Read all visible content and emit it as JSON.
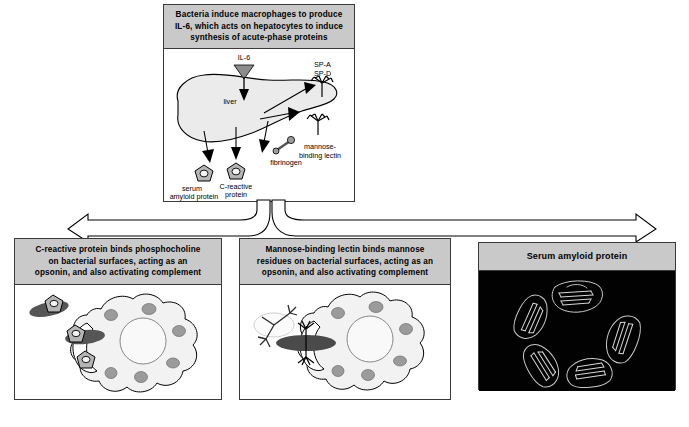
{
  "figure": {
    "domain": "biology-immunology-diagram",
    "background": "#ffffff"
  },
  "colors": {
    "caption_gray": "#c9c9c9",
    "border": "#3a3a3a",
    "liver_fill": "#ebebeb",
    "cell_fill": "#f2f2f2",
    "granule_fill": "#9b9b9b",
    "nucleus_fill": "#f7f7f7",
    "bacteria_dark": "#565656",
    "protein_fill": "#b5b5b5",
    "arrow_black": "#000000",
    "il6_triangle": "#8c8c8c",
    "panel3_black": "#020202",
    "ribbon_white": "#dedede"
  },
  "top_panel": {
    "caption": "Bacteria induce macrophages to produce IL-6, which acts on hepatocytes to induce synthesis of acute-phase proteins",
    "caption_lines": [
      "Bacteria induce macrophages to produce",
      "IL-6, which acts on hepatocytes to induce",
      "synthesis of acute-phase proteins"
    ],
    "labels": {
      "il6": "IL-6",
      "liver": "liver",
      "sp_a": "SP-A",
      "sp_d": "SP-D",
      "mannose_lectin_line1": "mannose-",
      "mannose_lectin_line2": "binding lectin",
      "fibrinogen": "fibrinogen",
      "crp_line1": "C-reactive",
      "crp_line2": "protein",
      "sap_line1": "serum",
      "sap_line2": "amyloid protein"
    },
    "products": [
      "serum amyloid protein",
      "C-reactive protein",
      "fibrinogen",
      "mannose-binding lectin",
      "SP-A",
      "SP-D"
    ]
  },
  "panel_crp": {
    "caption": "C-reactive protein binds phosphocholine on bacterial surfaces, acting as an opsonin, and also activating complement",
    "caption_lines": [
      "C-reactive protein binds phosphocholine",
      "on bacterial surfaces, acting as an",
      "opsonin, and also activating complement"
    ],
    "illustration": "macrophage engulfing CRP-opsonized bacteria"
  },
  "panel_mbl": {
    "caption": "Mannose-binding lectin binds mannose residues on bacterial surfaces, acting as an opsonin, and also activating complement",
    "caption_lines": [
      "Mannose-binding lectin binds mannose",
      "residues on bacterial surfaces, acting as an",
      "opsonin, and also activating complement"
    ],
    "illustration": "macrophage engulfing MBL-opsonized bacterium"
  },
  "panel_sap": {
    "caption": "Serum amyloid protein",
    "illustration": "pentameric ribbon structure on black background",
    "subunit_count": 5
  }
}
